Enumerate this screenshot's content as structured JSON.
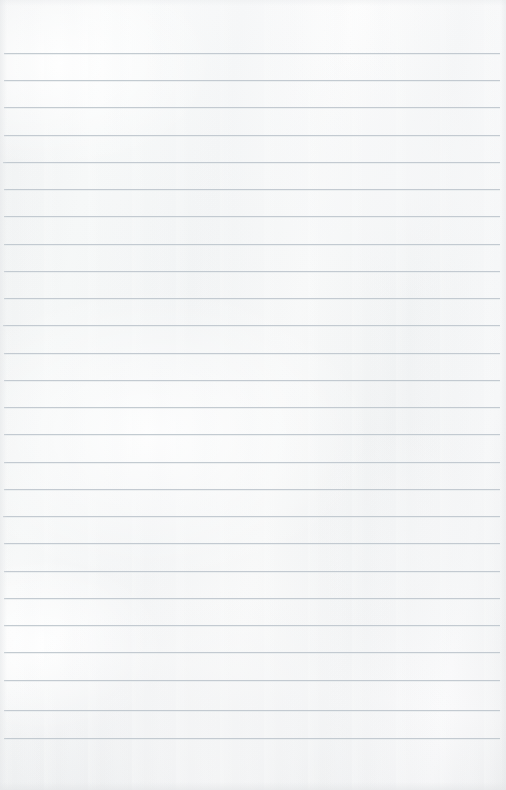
{
  "document": {
    "kind": "lined-notebook-page",
    "title": "Blank ruled paper page",
    "page_width": 506,
    "page_height": 790,
    "paper_color": "#f9fafa",
    "paper_highlight_color": "#ffffff",
    "paper_shadow_color": "#f2f3f4",
    "edge_shadow_color": "#e4e6e8",
    "content_text": ""
  },
  "ruling": {
    "line_color": "#bfc7ce",
    "line_secondary_color": "#e2e7ea",
    "line_thickness_px": 1,
    "line_spacing_px": 27.2,
    "first_line_y": 53,
    "last_line_y": 738,
    "line_left_x": 4,
    "line_right_x": 500,
    "line_count": 26,
    "top_margin_px": 53,
    "bottom_margin_px": 52,
    "left_margin_px": 4,
    "right_margin_px": 6,
    "has_vertical_margin_rule": false,
    "lines": [
      {
        "index": 1,
        "y": 53,
        "x1": 4,
        "x2": 500
      },
      {
        "index": 2,
        "y": 80,
        "x1": 4,
        "x2": 500
      },
      {
        "index": 3,
        "y": 107,
        "x1": 4,
        "x2": 500
      },
      {
        "index": 4,
        "y": 135,
        "x1": 4,
        "x2": 500
      },
      {
        "index": 5,
        "y": 162,
        "x1": 3,
        "x2": 500
      },
      {
        "index": 6,
        "y": 189,
        "x1": 4,
        "x2": 500
      },
      {
        "index": 7,
        "y": 216,
        "x1": 4,
        "x2": 500
      },
      {
        "index": 8,
        "y": 244,
        "x1": 4,
        "x2": 500
      },
      {
        "index": 9,
        "y": 271,
        "x1": 4,
        "x2": 500
      },
      {
        "index": 10,
        "y": 298,
        "x1": 4,
        "x2": 500
      },
      {
        "index": 11,
        "y": 325,
        "x1": 3,
        "x2": 500
      },
      {
        "index": 12,
        "y": 353,
        "x1": 4,
        "x2": 500
      },
      {
        "index": 13,
        "y": 380,
        "x1": 4,
        "x2": 500
      },
      {
        "index": 14,
        "y": 407,
        "x1": 4,
        "x2": 500
      },
      {
        "index": 15,
        "y": 434,
        "x1": 4,
        "x2": 500
      },
      {
        "index": 16,
        "y": 462,
        "x1": 4,
        "x2": 500
      },
      {
        "index": 17,
        "y": 489,
        "x1": 4,
        "x2": 500
      },
      {
        "index": 18,
        "y": 516,
        "x1": 3,
        "x2": 500
      },
      {
        "index": 19,
        "y": 543,
        "x1": 4,
        "x2": 500
      },
      {
        "index": 20,
        "y": 571,
        "x1": 4,
        "x2": 500
      },
      {
        "index": 21,
        "y": 598,
        "x1": 4,
        "x2": 500
      },
      {
        "index": 22,
        "y": 625,
        "x1": 4,
        "x2": 500
      },
      {
        "index": 23,
        "y": 652,
        "x1": 4,
        "x2": 500
      },
      {
        "index": 24,
        "y": 680,
        "x1": 4,
        "x2": 500
      },
      {
        "index": 25,
        "y": 710,
        "x1": 4,
        "x2": 500
      },
      {
        "index": 26,
        "y": 738,
        "x1": 4,
        "x2": 500
      }
    ]
  }
}
